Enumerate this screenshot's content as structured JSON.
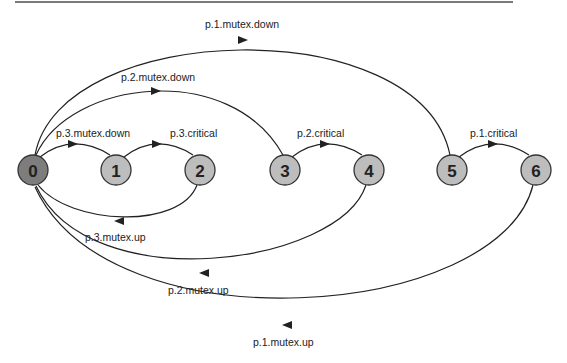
{
  "diagram": {
    "type": "state-transition-graph",
    "nodes": [
      {
        "id": "0",
        "label": "0",
        "fill": "#7d7d7d",
        "initial": true
      },
      {
        "id": "1",
        "label": "1",
        "fill": "#bdbdbd"
      },
      {
        "id": "2",
        "label": "2",
        "fill": "#bdbdbd"
      },
      {
        "id": "3",
        "label": "3",
        "fill": "#bdbdbd"
      },
      {
        "id": "4",
        "label": "4",
        "fill": "#bdbdbd"
      },
      {
        "id": "5",
        "label": "5",
        "fill": "#bdbdbd"
      },
      {
        "id": "6",
        "label": "6",
        "fill": "#bdbdbd"
      }
    ],
    "edges": [
      {
        "from": "0",
        "to": "1",
        "label": "p.3.mutex.down"
      },
      {
        "from": "1",
        "to": "2",
        "label": "p.3.critical"
      },
      {
        "from": "2",
        "to": "0",
        "label": "p.3.mutex.up"
      },
      {
        "from": "0",
        "to": "3",
        "label": "p.2.mutex.down"
      },
      {
        "from": "3",
        "to": "4",
        "label": "p.2.critical"
      },
      {
        "from": "4",
        "to": "0",
        "label": "p.2.mutex.up"
      },
      {
        "from": "0",
        "to": "5",
        "label": "p.1.mutex.down"
      },
      {
        "from": "5",
        "to": "6",
        "label": "p.1.critical"
      },
      {
        "from": "6",
        "to": "0",
        "label": "p.1.mutex.up"
      }
    ],
    "colors": {
      "edge": "#222222",
      "node_stroke": "#333333",
      "initial_fill": "#7d7d7d",
      "node_fill": "#bdbdbd"
    }
  }
}
